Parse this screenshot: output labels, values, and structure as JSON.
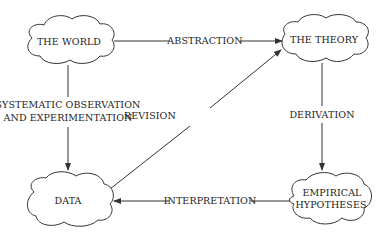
{
  "diagram": {
    "type": "flow-cycle",
    "nodes": [
      {
        "id": "world",
        "label": "THE WORLD",
        "shape": "cloud"
      },
      {
        "id": "theory",
        "label": "THE THEORY",
        "shape": "cloud"
      },
      {
        "id": "hypotheses",
        "label_lines": [
          "EMPIRICAL",
          "HYPOTHESES"
        ],
        "shape": "cloud"
      },
      {
        "id": "data",
        "label": "DATA",
        "shape": "cloud"
      }
    ],
    "edges": [
      {
        "from": "world",
        "to": "theory",
        "label": "ABSTRACTION"
      },
      {
        "from": "theory",
        "to": "hypotheses",
        "label": "DERIVATION"
      },
      {
        "from": "hypotheses",
        "to": "data",
        "label": "INTERPRETATION"
      },
      {
        "from": "data",
        "to": "theory",
        "label": "REVISION"
      },
      {
        "from": "world",
        "to": "data",
        "label_lines": [
          "SYSTEMATIC OBSERVATION",
          "AND EXPERIMENTATION"
        ]
      }
    ],
    "colors": {
      "stroke": "#333333",
      "text": "#222222",
      "background": "#ffffff"
    }
  }
}
